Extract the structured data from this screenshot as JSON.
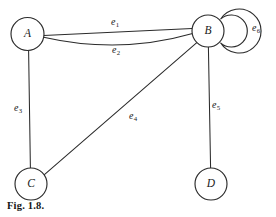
{
  "figure": {
    "caption": "Fig. 1.8.",
    "width": 276,
    "height": 217,
    "background": "#ffffff",
    "ink_color": "#2b2b2b"
  },
  "graph": {
    "type": "multigraph-diagram",
    "nodes": [
      {
        "id": "A",
        "label": "A",
        "cx": 27.5,
        "cy": 34,
        "r": 16.5
      },
      {
        "id": "B",
        "label": "B",
        "cx": 208,
        "cy": 31,
        "r": 16
      },
      {
        "id": "C",
        "label": "C",
        "cx": 31,
        "cy": 184,
        "r": 16
      },
      {
        "id": "D",
        "label": "D",
        "cx": 211,
        "cy": 184,
        "r": 16
      }
    ],
    "edges": [
      {
        "id": "e1",
        "label": "e",
        "sub": "1",
        "from": "A",
        "to": "B",
        "shape": "straight",
        "label_x": 115,
        "label_y": 22
      },
      {
        "id": "e2",
        "label": "e",
        "sub": "2",
        "from": "A",
        "to": "B",
        "shape": "curved-down",
        "label_x": 116,
        "label_y": 50
      },
      {
        "id": "e3",
        "label": "e",
        "sub": "3",
        "from": "A",
        "to": "C",
        "shape": "straight",
        "label_x": 18,
        "label_y": 108
      },
      {
        "id": "e4",
        "label": "e",
        "sub": "4",
        "from": "B",
        "to": "C",
        "shape": "straight",
        "label_x": 133,
        "label_y": 116
      },
      {
        "id": "e5",
        "label": "e",
        "sub": "5",
        "from": "B",
        "to": "D",
        "shape": "straight",
        "label_x": 216,
        "label_y": 105
      },
      {
        "id": "e6",
        "label": "e",
        "sub": "6",
        "from": "B",
        "to": "B",
        "shape": "self-loop",
        "label_x": 256,
        "label_y": 28
      }
    ]
  }
}
